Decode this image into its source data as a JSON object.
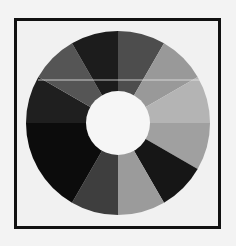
{
  "chart_data": {
    "type": "pie",
    "subtype": "donut",
    "title": "",
    "legend": [],
    "start_angle_deg": 0,
    "direction": "clockwise",
    "center": [
      118,
      123
    ],
    "outer_radius": 92,
    "inner_radius": 32,
    "segments": [
      {
        "start": 0,
        "end": 30,
        "value": 30,
        "color": "#4d4d4d"
      },
      {
        "start": 30,
        "end": 60,
        "value": 30,
        "color": "#999999"
      },
      {
        "start": 60,
        "end": 90,
        "value": 30,
        "color": "#b4b4b4"
      },
      {
        "start": 90,
        "end": 120,
        "value": 30,
        "color": "#a0a0a0"
      },
      {
        "start": 120,
        "end": 150,
        "value": 30,
        "color": "#161616"
      },
      {
        "start": 150,
        "end": 180,
        "value": 30,
        "color": "#9b9b9b"
      },
      {
        "start": 180,
        "end": 210,
        "value": 30,
        "color": "#3e3e3e"
      },
      {
        "start": 210,
        "end": 270,
        "value": 60,
        "color": "#0c0c0c"
      },
      {
        "start": 270,
        "end": 300,
        "value": 30,
        "color": "#1f1f1f"
      },
      {
        "start": 300,
        "end": 330,
        "value": 30,
        "color": "#555555"
      },
      {
        "start": 330,
        "end": 360,
        "value": 30,
        "color": "#1c1c1c"
      }
    ],
    "values": [
      30,
      30,
      30,
      30,
      30,
      30,
      30,
      60,
      30,
      30,
      30
    ],
    "hole_color": "#f6f6f6",
    "frame": {
      "border_color": "#111111",
      "background": "#f1f1f1"
    },
    "artifact_line": {
      "y": 80,
      "x1": 38,
      "x2": 200,
      "color": "#e8e8e8"
    }
  }
}
